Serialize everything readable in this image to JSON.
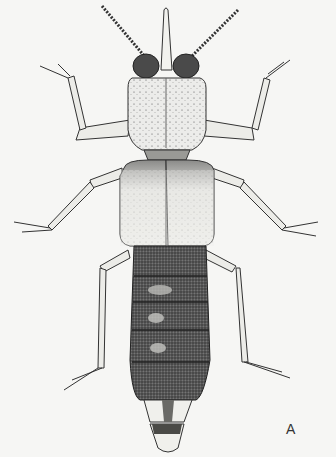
{
  "figure": {
    "panel_label": "A",
    "colors": {
      "background": "#f6f6f4",
      "ink": "#2a2a2a",
      "light_body": "#e8e8e4",
      "dark_body": "#4a4a4a"
    }
  }
}
